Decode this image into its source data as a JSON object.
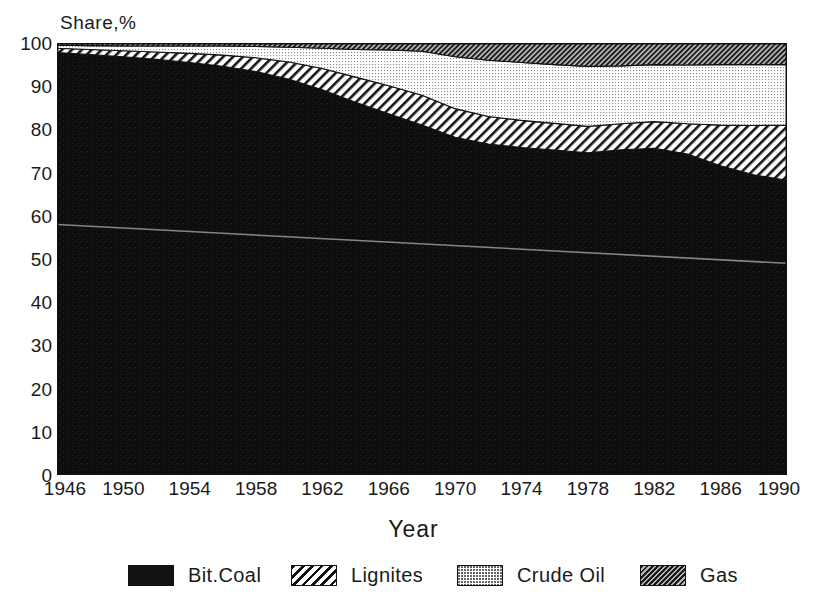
{
  "chart_data": {
    "type": "area",
    "title": "",
    "subtitle": "",
    "xlabel": "Year",
    "ylabel": "Share,%",
    "stacked": true,
    "percent_stacked": true,
    "grid": false,
    "legend_position": "bottom",
    "xlim": [
      1946,
      1990
    ],
    "ylim": [
      0,
      100
    ],
    "ytick_labels": [
      "0",
      "10",
      "20",
      "30",
      "40",
      "50",
      "60",
      "70",
      "80",
      "90",
      "100"
    ],
    "ytick_values": [
      0,
      10,
      20,
      30,
      40,
      50,
      60,
      70,
      80,
      90,
      100
    ],
    "xtick_labels": [
      "1946",
      "1950",
      "1954",
      "1958",
      "1962",
      "1966",
      "1970",
      "1974",
      "1978",
      "1982",
      "1986",
      "1990"
    ],
    "xtick_values": [
      1946,
      1950,
      1954,
      1958,
      1962,
      1966,
      1970,
      1974,
      1978,
      1982,
      1986,
      1990
    ],
    "x": [
      1946,
      1948,
      1950,
      1952,
      1954,
      1956,
      1958,
      1960,
      1962,
      1964,
      1966,
      1968,
      1970,
      1972,
      1974,
      1976,
      1978,
      1980,
      1982,
      1984,
      1986,
      1988,
      1990
    ],
    "series": [
      {
        "name": "Bit.Coal",
        "fill": "solid-black",
        "color": "#111111",
        "values": [
          97.8,
          97.3,
          96.8,
          96.2,
          95.5,
          94.6,
          93.4,
          91.6,
          89.2,
          86.3,
          83.6,
          81.0,
          78.2,
          76.6,
          75.8,
          75.2,
          74.6,
          75.3,
          75.6,
          74.3,
          71.6,
          69.5,
          68.2
        ]
      },
      {
        "name": "Lignites",
        "fill": "diagonal-hatch",
        "color": "#ffffff",
        "values": [
          1.0,
          1.2,
          1.4,
          1.7,
          2.1,
          2.6,
          3.2,
          4.0,
          4.9,
          5.8,
          6.5,
          6.9,
          6.6,
          6.4,
          6.3,
          6.2,
          6.1,
          6.0,
          6.2,
          7.0,
          9.4,
          11.4,
          12.8
        ]
      },
      {
        "name": "Crude Oil",
        "fill": "fine-dot-stipple",
        "color": "#e8e8e8",
        "values": [
          0.7,
          0.9,
          1.1,
          1.4,
          1.7,
          2.1,
          2.6,
          3.4,
          4.7,
          6.4,
          8.3,
          10.2,
          12.0,
          13.0,
          13.4,
          13.6,
          13.9,
          13.4,
          13.2,
          13.6,
          14.0,
          14.1,
          14.0
        ]
      },
      {
        "name": "Gas",
        "fill": "dense-dark-hatch",
        "color": "#4d4d4d",
        "values": [
          0.5,
          0.6,
          0.7,
          0.7,
          0.7,
          0.7,
          0.8,
          1.0,
          1.2,
          1.5,
          1.6,
          1.9,
          3.2,
          4.0,
          4.5,
          5.0,
          5.4,
          5.3,
          5.0,
          5.1,
          5.0,
          5.0,
          5.0
        ]
      }
    ],
    "cumulative_tops": {
      "bit_coal": [
        97.8,
        97.3,
        96.8,
        96.2,
        95.5,
        94.6,
        93.4,
        91.6,
        89.2,
        86.3,
        83.6,
        81.0,
        78.2,
        76.6,
        75.8,
        75.2,
        74.6,
        75.3,
        75.6,
        74.3,
        71.6,
        69.5,
        68.2
      ],
      "lignites": [
        98.8,
        98.5,
        98.2,
        97.9,
        97.6,
        97.2,
        96.6,
        95.6,
        94.1,
        92.1,
        90.1,
        87.9,
        84.8,
        83.0,
        82.1,
        81.4,
        80.7,
        81.3,
        81.8,
        81.3,
        81.0,
        80.9,
        81.0
      ],
      "crude_oil": [
        99.5,
        99.4,
        99.3,
        99.3,
        99.3,
        99.3,
        99.2,
        99.0,
        98.8,
        98.5,
        98.4,
        98.1,
        96.8,
        96.0,
        95.5,
        95.0,
        94.6,
        94.7,
        95.0,
        94.9,
        95.0,
        95.0,
        95.0
      ],
      "gas": [
        100,
        100,
        100,
        100,
        100,
        100,
        100,
        100,
        100,
        100,
        100,
        100,
        100,
        100,
        100,
        100,
        100,
        100,
        100,
        100,
        100,
        100,
        100
      ]
    },
    "annotations": [
      {
        "name": "scan-artifact-line",
        "from": {
          "x": 1946,
          "y": 58
        },
        "to": {
          "x": 1990,
          "y": 49
        }
      }
    ]
  },
  "axes": {
    "y_title": "Share,%",
    "x_title": "Year",
    "y_ticks": [
      "100",
      "90",
      "80",
      "70",
      "60",
      "50",
      "40",
      "30",
      "20",
      "10",
      "0"
    ],
    "x_ticks": [
      "1946",
      "1950",
      "1954",
      "1958",
      "1962",
      "1966",
      "1970",
      "1974",
      "1978",
      "1982",
      "1986",
      "1990"
    ]
  },
  "legend": {
    "items": [
      {
        "label": "Bit.Coal",
        "swatch": "solid-black-swatch"
      },
      {
        "label": "Lignites",
        "swatch": "diagonal-hatch-swatch"
      },
      {
        "label": "Crude Oil",
        "swatch": "dotted-light-swatch"
      },
      {
        "label": "Gas",
        "swatch": "dense-dark-hatch-swatch"
      }
    ]
  },
  "colors": {
    "bit_coal": "#111111",
    "lignites": "#ffffff",
    "crude_oil": "#e8e8e8",
    "gas": "#4d4d4d",
    "background": "#ffffff",
    "text": "#1a1a1a"
  }
}
